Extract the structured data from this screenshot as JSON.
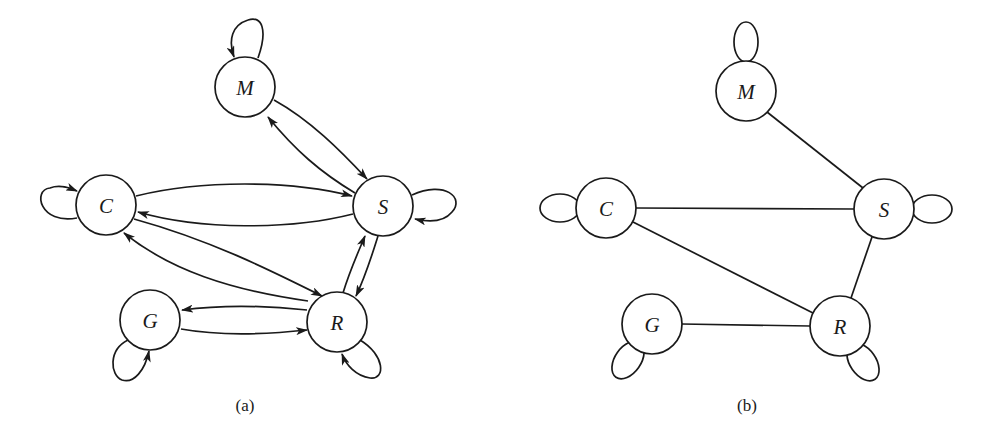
{
  "figure": {
    "panels": [
      {
        "id": "a",
        "caption": "(a)",
        "type": "directed",
        "nodes": [
          {
            "id": "M",
            "label": "M"
          },
          {
            "id": "C",
            "label": "C"
          },
          {
            "id": "S",
            "label": "S"
          },
          {
            "id": "G",
            "label": "G"
          },
          {
            "id": "R",
            "label": "R"
          }
        ],
        "edges": [
          {
            "from": "M",
            "to": "M"
          },
          {
            "from": "M",
            "to": "S"
          },
          {
            "from": "S",
            "to": "M"
          },
          {
            "from": "C",
            "to": "C"
          },
          {
            "from": "C",
            "to": "S"
          },
          {
            "from": "S",
            "to": "C"
          },
          {
            "from": "S",
            "to": "S"
          },
          {
            "from": "C",
            "to": "R"
          },
          {
            "from": "R",
            "to": "C"
          },
          {
            "from": "S",
            "to": "R"
          },
          {
            "from": "R",
            "to": "S"
          },
          {
            "from": "G",
            "to": "R"
          },
          {
            "from": "R",
            "to": "G"
          },
          {
            "from": "G",
            "to": "G"
          },
          {
            "from": "R",
            "to": "R"
          }
        ]
      },
      {
        "id": "b",
        "caption": "(b)",
        "type": "undirected",
        "nodes": [
          {
            "id": "M",
            "label": "M"
          },
          {
            "id": "C",
            "label": "C"
          },
          {
            "id": "S",
            "label": "S"
          },
          {
            "id": "G",
            "label": "G"
          },
          {
            "id": "R",
            "label": "R"
          }
        ],
        "edges": [
          {
            "from": "M",
            "to": "M"
          },
          {
            "from": "M",
            "to": "S"
          },
          {
            "from": "C",
            "to": "C"
          },
          {
            "from": "C",
            "to": "S"
          },
          {
            "from": "S",
            "to": "S"
          },
          {
            "from": "C",
            "to": "R"
          },
          {
            "from": "S",
            "to": "R"
          },
          {
            "from": "G",
            "to": "R"
          },
          {
            "from": "G",
            "to": "G"
          },
          {
            "from": "R",
            "to": "R"
          }
        ]
      }
    ],
    "colors": {
      "stroke": "#1a1a1a",
      "background": "#ffffff"
    }
  }
}
